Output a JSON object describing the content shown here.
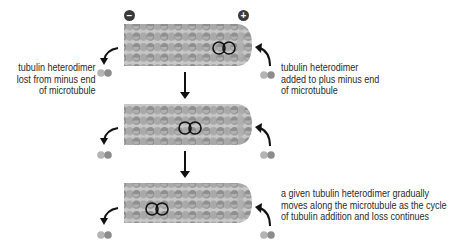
{
  "diagram": {
    "poles": {
      "minus": "−",
      "plus": "+"
    },
    "labels": {
      "minus_end_loss": [
        "tubulin heterodimer",
        "lost from minus end",
        "of microtubule"
      ],
      "plus_end_addition": [
        "tubulin heterodimer",
        "added to plus minus end",
        "of microtubule"
      ],
      "movement_note": [
        "a given tubulin heterodimer gradually",
        "moves along the microtubule as the cycle",
        "of tubulin addition and loss continues"
      ]
    },
    "stages": [
      {
        "index": 1,
        "highlighted_dimer_position": "near plus end"
      },
      {
        "index": 2,
        "highlighted_dimer_position": "middle"
      },
      {
        "index": 3,
        "highlighted_dimer_position": "near minus end"
      }
    ],
    "colors": {
      "subunit_light": "#b4b4b4",
      "subunit_dark": "#8c8c8c",
      "pole_fill": "#3a3a3a",
      "arrow": "#111111",
      "outline": "#111111"
    }
  }
}
